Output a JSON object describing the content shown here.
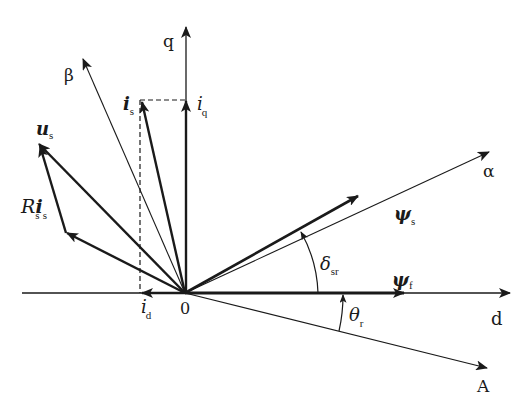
{
  "diagram": {
    "colors": {
      "stroke": "#1a1a1a",
      "background": "#ffffff"
    },
    "origin": {
      "label": "0"
    },
    "axes": {
      "d": {
        "label": "d"
      },
      "q": {
        "label": "q"
      },
      "alpha": {
        "label": "α"
      },
      "beta": {
        "label": "β"
      },
      "A": {
        "label": "A"
      }
    },
    "vectors": {
      "is": {
        "main": "i",
        "sub": "s"
      },
      "iq": {
        "main": "i",
        "sub": "q"
      },
      "id": {
        "main": "i",
        "sub": "d"
      },
      "us": {
        "main": "u",
        "sub": "s"
      },
      "rsis": {
        "r": "R",
        "r_sub": "s",
        "i": "i",
        "i_sub": "s"
      },
      "psis": {
        "main": "ψ",
        "sub": "s"
      },
      "psif": {
        "main": "ψ",
        "sub": "f"
      }
    },
    "angles": {
      "delta_sr": {
        "main": "δ",
        "sub": "sr"
      },
      "theta_r": {
        "main": "θ",
        "sub": "r"
      }
    }
  }
}
